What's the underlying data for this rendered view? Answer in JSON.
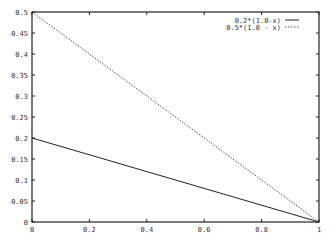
{
  "chart_data": {
    "type": "line",
    "title": "",
    "xlabel": "",
    "ylabel": "",
    "xlim": [
      0,
      1
    ],
    "ylim": [
      0,
      0.5
    ],
    "grid": false,
    "legend_position": "top-right inside",
    "x_ticks": [
      "0",
      "0.2",
      "0.4",
      "0.6",
      "0.8",
      "1"
    ],
    "y_ticks": [
      "0",
      "0.05",
      "0.1",
      "0.15",
      "0.2",
      "0.25",
      "0.3",
      "0.35",
      "0.4",
      "0.45",
      "0.5"
    ],
    "series": [
      {
        "name": "0.2*(1.0-x)",
        "style": "solid",
        "x": [
          0,
          1
        ],
        "y": [
          0.2,
          0.0
        ]
      },
      {
        "name": "0.5*(1.0 - x)",
        "style": "dotted",
        "x": [
          0,
          1
        ],
        "y": [
          0.5,
          0.0
        ]
      }
    ]
  }
}
